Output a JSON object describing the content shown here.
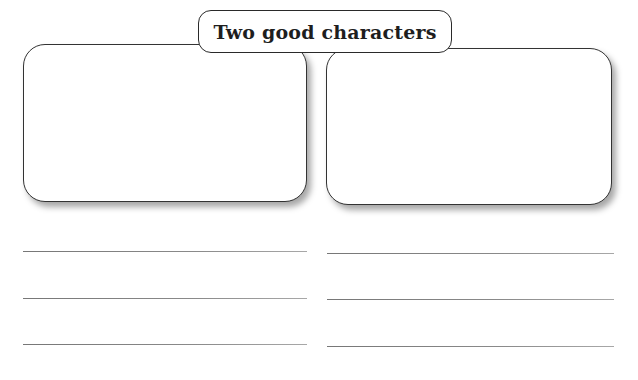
{
  "worksheet": {
    "title": "Two good characters",
    "boxes": [
      {
        "id": "left",
        "content": ""
      },
      {
        "id": "right",
        "content": ""
      }
    ],
    "writing_lines": {
      "left": [
        "",
        "",
        ""
      ],
      "right": [
        "",
        "",
        ""
      ]
    },
    "colors": {
      "border": "#333333",
      "line": "#808080",
      "background": "#ffffff",
      "title_text": "#1e1e1e"
    }
  }
}
